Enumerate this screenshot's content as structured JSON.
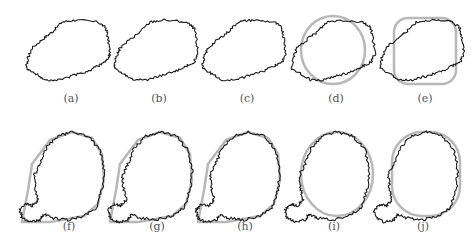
{
  "figure": {
    "panels": [
      {
        "label": "(a)",
        "row": 0,
        "col": 0,
        "fit": "none"
      },
      {
        "label": "(b)",
        "row": 0,
        "col": 1,
        "fit": "none"
      },
      {
        "label": "(c)",
        "row": 0,
        "col": 2,
        "fit": "none"
      },
      {
        "label": "(d)",
        "row": 0,
        "col": 3,
        "fit": "circle"
      },
      {
        "label": "(e)",
        "row": 0,
        "col": 4,
        "fit": "rounded-rectangle"
      },
      {
        "label": "(f)",
        "row": 1,
        "col": 0,
        "fit": "polygon"
      },
      {
        "label": "(g)",
        "row": 1,
        "col": 1,
        "fit": "polygon"
      },
      {
        "label": "(h)",
        "row": 1,
        "col": 2,
        "fit": "polygon"
      },
      {
        "label": "(i)",
        "row": 1,
        "col": 3,
        "fit": "circle"
      },
      {
        "label": "(j)",
        "row": 1,
        "col": 4,
        "fit": "rounded-rectangle"
      }
    ],
    "colors": {
      "contour": "#1a1a1a",
      "fit": "#b8b8b8",
      "caption": "#555555"
    }
  }
}
